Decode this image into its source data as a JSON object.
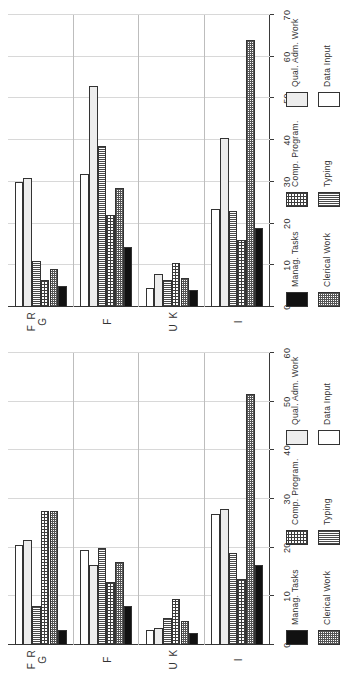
{
  "figure": {
    "panel_count": 2,
    "orientation": "rotated-90",
    "groups": [
      "I",
      "U K",
      "F",
      "F R G"
    ],
    "series_labels": [
      "Manag. Tasks",
      "Clerical Work",
      "Comp. Program.",
      "Typing",
      "Qual. Adm. Work",
      "Data Input"
    ],
    "legend_columns": [
      [
        "Manag. Tasks",
        "Clerical Work"
      ],
      [
        "Comp. Program.",
        "Typing"
      ],
      [
        "Qual. Adm. Work",
        "Data Input"
      ]
    ]
  },
  "chart_data": [
    {
      "id": "panel-top",
      "type": "bar",
      "orientation": "horizontal",
      "title": "",
      "xlabel": "",
      "ylabel": "",
      "categories": [
        "I",
        "U K",
        "F",
        "F R G"
      ],
      "series": [
        {
          "name": "Manag. Tasks",
          "values": [
            19.0,
            4.0,
            14.5,
            5.0
          ]
        },
        {
          "name": "Clerical Work",
          "values": [
            64.0,
            7.0,
            28.5,
            9.0
          ]
        },
        {
          "name": "Comp. Program.",
          "values": [
            16.0,
            10.5,
            22.0,
            6.5
          ]
        },
        {
          "name": "Typing",
          "values": [
            23.0,
            6.5,
            38.5,
            11.0
          ]
        },
        {
          "name": "Qual. Adm. Work",
          "values": [
            40.5,
            8.0,
            53.0,
            31.0
          ]
        },
        {
          "name": "Data Input",
          "values": [
            23.5,
            4.5,
            32.0,
            30.0
          ]
        }
      ],
      "xlim": [
        0,
        70
      ],
      "xticks": [
        0,
        10,
        20,
        30,
        40,
        50,
        60,
        70
      ],
      "xticklabels": [
        "0",
        "10",
        "20",
        "30",
        "40",
        "50",
        "60",
        "70"
      ],
      "grid": true,
      "legend_position": "bottom"
    },
    {
      "id": "panel-bottom",
      "type": "bar",
      "orientation": "horizontal",
      "title": "",
      "xlabel": "",
      "ylabel": "",
      "categories": [
        "I",
        "U K",
        "F",
        "F R G"
      ],
      "series": [
        {
          "name": "Manag. Tasks",
          "values": [
            16.5,
            2.5,
            8.0,
            3.0
          ]
        },
        {
          "name": "Clerical Work",
          "values": [
            51.5,
            5.0,
            17.0,
            27.5
          ]
        },
        {
          "name": "Comp. Program.",
          "values": [
            13.5,
            9.5,
            13.0,
            27.5
          ]
        },
        {
          "name": "Typing",
          "values": [
            19.0,
            5.5,
            20.0,
            8.0
          ]
        },
        {
          "name": "Qual. Adm. Work",
          "values": [
            28.0,
            3.5,
            16.5,
            21.5
          ]
        },
        {
          "name": "Data Input",
          "values": [
            27.0,
            3.0,
            19.5,
            20.5
          ]
        }
      ],
      "xlim": [
        0,
        60
      ],
      "xticks": [
        0,
        10,
        20,
        30,
        40,
        50,
        60
      ],
      "xticklabels": [
        "0",
        "10",
        "20",
        "30",
        "40",
        "50",
        "60"
      ],
      "grid": true,
      "legend_position": "bottom"
    }
  ],
  "colors": {
    "manag_tasks": "#111111",
    "clerical_work": "#555555",
    "comp_program": "#3d3d3d",
    "typing": "#4a4a4a",
    "qual_adm_work": "#ededed",
    "data_input": "#ffffff",
    "axis": "#3a3a3a",
    "grid": "#d8d8d8",
    "background": "#ffffff"
  }
}
